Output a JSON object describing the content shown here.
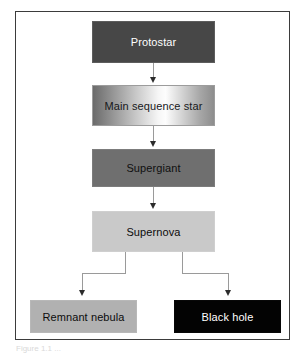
{
  "figure": {
    "caption_partial": "Figure 1.1 ...",
    "frame_border_color": "#3b3b3b",
    "background_color": "#ffffff",
    "connector_color": "#9a9a9a",
    "arrowhead_color": "#2b2b2b"
  },
  "diagram_data": {
    "type": "flowchart",
    "orientation": "top-to-bottom",
    "nodes": [
      {
        "id": "protostar",
        "label": "Protostar",
        "fill": "#474747",
        "text_color": "#ffffff",
        "shape": "rectangle"
      },
      {
        "id": "main-sequence-star",
        "label": "Main sequence star",
        "fill": "gradient-dark-to-white-to-gray",
        "text_color": "#17181a",
        "shape": "rectangle"
      },
      {
        "id": "supergiant",
        "label": "Supergiant",
        "fill": "#6f6f6f",
        "text_color": "#101010",
        "shape": "rectangle"
      },
      {
        "id": "supernova",
        "label": "Supernova",
        "fill": "#c9c9c9",
        "text_color": "#0c0c0c",
        "shape": "rectangle"
      },
      {
        "id": "remnant-nebula",
        "label": "Remnant nebula",
        "fill": "#b1b1b1",
        "text_color": "#0c0c0c",
        "shape": "rectangle"
      },
      {
        "id": "black-hole",
        "label": "Black hole",
        "fill": "#030303",
        "text_color": "#ffffff",
        "shape": "rectangle"
      }
    ],
    "edges": [
      {
        "from": "protostar",
        "to": "main-sequence-star",
        "style": "straight-arrow"
      },
      {
        "from": "main-sequence-star",
        "to": "supergiant",
        "style": "straight-arrow"
      },
      {
        "from": "supergiant",
        "to": "supernova",
        "style": "straight-arrow"
      },
      {
        "from": "supernova",
        "to": "remnant-nebula",
        "style": "elbow-arrow-left"
      },
      {
        "from": "supernova",
        "to": "black-hole",
        "style": "elbow-arrow-right"
      }
    ]
  }
}
